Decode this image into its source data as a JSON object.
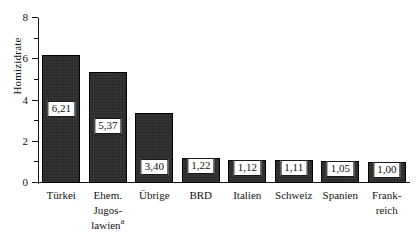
{
  "chart_data": {
    "type": "bar",
    "title": "",
    "xlabel": "",
    "ylabel": "Homizidrate",
    "ylim": [
      0,
      8
    ],
    "y_ticks": [
      0,
      1,
      2,
      3,
      4,
      5,
      6,
      7,
      8
    ],
    "y_tick_labels": [
      "0",
      "",
      "2",
      "",
      "4",
      "",
      "6",
      "",
      "8"
    ],
    "grid": false,
    "legend": "none",
    "categories": [
      "Türkei",
      "Ehem. Jugoslawien",
      "Übrige",
      "BRD",
      "Italien",
      "Schweiz",
      "Spanien",
      "Frankreich"
    ],
    "values": [
      6.21,
      5.37,
      3.4,
      1.22,
      1.12,
      1.11,
      1.05,
      1.0
    ],
    "value_labels": [
      "6,21",
      "5,37",
      "3,40",
      "1,22",
      "1,12",
      "1,11",
      "1,05",
      "1,00"
    ],
    "category_label_lines": [
      [
        "Türkei"
      ],
      [
        "Ehem.",
        "Jugos-",
        "lawien"
      ],
      [
        "Übrige"
      ],
      [
        "BRD"
      ],
      [
        "Italien"
      ],
      [
        "Schweiz"
      ],
      [
        "Spanien"
      ],
      [
        "Frank-",
        "reich"
      ]
    ],
    "footnote_marker": "a",
    "footnote_marker_category_index": 1,
    "bar_color": "#2a2a2a",
    "axis_color": "#111111",
    "background_color": "#ffffff"
  }
}
